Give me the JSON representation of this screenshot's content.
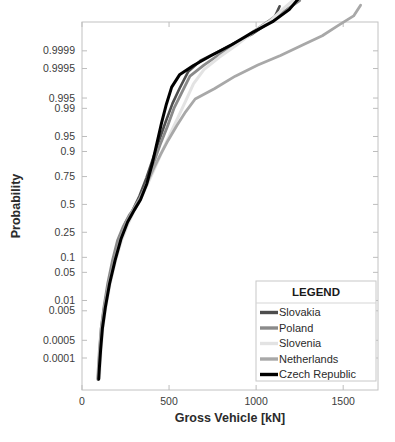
{
  "chart_data": {
    "type": "line",
    "title": "",
    "xlabel": "Gross Vehicle [kN]",
    "ylabel": "Probability",
    "grid": false,
    "legend_position": "bottom-right",
    "legend_title": "LEGEND",
    "xlim": [
      0,
      1700
    ],
    "xticks": [
      0,
      500,
      1000,
      1500
    ],
    "xticklabels": [
      "0",
      "500",
      "1000",
      "1500"
    ],
    "yscale": "normal-probability",
    "yticks": [
      0.0001,
      0.0005,
      0.005,
      0.01,
      0.05,
      0.1,
      0.25,
      0.5,
      0.75,
      0.9,
      0.95,
      0.99,
      0.995,
      0.9995,
      0.9999
    ],
    "yticklabels": [
      "0.0001",
      "0.0005",
      "0.005",
      "0.01",
      "0.05",
      "0.1",
      "0.25",
      "0.5",
      "0.75",
      "0.9",
      "0.95",
      "0.99",
      "0.995",
      "0.9995",
      "0.9999"
    ],
    "series": [
      {
        "name": "Slovakia",
        "color": "#4d4d4d",
        "width": 2.6,
        "points": [
          [
            95,
            1.2e-05
          ],
          [
            98,
            4e-05
          ],
          [
            104,
            0.0002
          ],
          [
            112,
            0.0012
          ],
          [
            128,
            0.006
          ],
          [
            150,
            0.025
          ],
          [
            180,
            0.08
          ],
          [
            215,
            0.2
          ],
          [
            250,
            0.33
          ],
          [
            290,
            0.44
          ],
          [
            330,
            0.58
          ],
          [
            370,
            0.74
          ],
          [
            405,
            0.86
          ],
          [
            440,
            0.935
          ],
          [
            480,
            0.977
          ],
          [
            520,
            0.9928
          ],
          [
            560,
            0.9975
          ],
          [
            610,
            0.99935
          ],
          [
            680,
            0.99975
          ],
          [
            780,
            0.99989
          ],
          [
            880,
            0.999955
          ],
          [
            980,
            0.999982
          ],
          [
            1060,
            0.9999935
          ],
          [
            1110,
            0.9999975
          ],
          [
            1135,
            0.9999992
          ]
        ]
      },
      {
        "name": "Poland",
        "color": "#8a8a8a",
        "width": 2.8,
        "points": [
          [
            92,
            1.1e-05
          ],
          [
            96,
            4e-05
          ],
          [
            102,
            0.00022
          ],
          [
            110,
            0.0013
          ],
          [
            126,
            0.0065
          ],
          [
            148,
            0.028
          ],
          [
            176,
            0.09
          ],
          [
            205,
            0.195
          ],
          [
            238,
            0.3
          ],
          [
            272,
            0.4
          ],
          [
            305,
            0.47
          ],
          [
            340,
            0.57
          ],
          [
            378,
            0.72
          ],
          [
            412,
            0.845
          ],
          [
            448,
            0.925
          ],
          [
            490,
            0.97
          ],
          [
            530,
            0.9905
          ],
          [
            575,
            0.9968
          ],
          [
            620,
            0.99905
          ],
          [
            700,
            0.99963
          ],
          [
            800,
            0.999875
          ],
          [
            900,
            0.999955
          ],
          [
            1000,
            0.9999885
          ],
          [
            1090,
            0.9999965
          ],
          [
            1175,
            0.9999988
          ],
          [
            1250,
            0.9999996
          ]
        ]
      },
      {
        "name": "Slovenia",
        "color": "#e3e3e3",
        "width": 3.0,
        "points": [
          [
            100,
            1.3e-05
          ],
          [
            104,
            4.5e-05
          ],
          [
            110,
            0.00024
          ],
          [
            120,
            0.0014
          ],
          [
            138,
            0.0068
          ],
          [
            162,
            0.028
          ],
          [
            192,
            0.085
          ],
          [
            228,
            0.195
          ],
          [
            262,
            0.31
          ],
          [
            300,
            0.44
          ],
          [
            340,
            0.565
          ],
          [
            380,
            0.7
          ],
          [
            420,
            0.815
          ],
          [
            460,
            0.9
          ],
          [
            505,
            0.955
          ],
          [
            550,
            0.982
          ],
          [
            595,
            0.9938
          ],
          [
            640,
            0.99825
          ],
          [
            700,
            0.99945
          ],
          [
            790,
            0.99982
          ],
          [
            890,
            0.999945
          ],
          [
            990,
            0.9999865
          ],
          [
            1080,
            0.9999955
          ],
          [
            1150,
            0.9999988
          ],
          [
            1210,
            0.9999996
          ]
        ]
      },
      {
        "name": "Netherlands",
        "color": "#a8a8a8",
        "width": 2.8,
        "points": [
          [
            90,
            1.2e-05
          ],
          [
            94,
            4.2e-05
          ],
          [
            100,
            0.00023
          ],
          [
            110,
            0.0013
          ],
          [
            128,
            0.0062
          ],
          [
            152,
            0.026
          ],
          [
            185,
            0.085
          ],
          [
            222,
            0.21
          ],
          [
            258,
            0.34
          ],
          [
            295,
            0.455
          ],
          [
            332,
            0.56
          ],
          [
            370,
            0.685
          ],
          [
            408,
            0.8
          ],
          [
            450,
            0.885
          ],
          [
            495,
            0.94
          ],
          [
            545,
            0.972
          ],
          [
            595,
            0.9875
          ],
          [
            650,
            0.99465
          ],
          [
            760,
            0.99745
          ],
          [
            880,
            0.99905
          ],
          [
            1010,
            0.99963
          ],
          [
            1140,
            0.999845
          ],
          [
            1270,
            0.999945
          ],
          [
            1380,
            0.999978
          ],
          [
            1470,
            0.9999925
          ],
          [
            1560,
            0.9999975
          ],
          [
            1600,
            0.9999993
          ]
        ]
      },
      {
        "name": "Czech Republic",
        "color": "#000000",
        "width": 3.0,
        "points": [
          [
            96,
            1.15e-05
          ],
          [
            100,
            4e-05
          ],
          [
            107,
            0.00022
          ],
          [
            117,
            0.0013
          ],
          [
            134,
            0.0063
          ],
          [
            158,
            0.027
          ],
          [
            190,
            0.088
          ],
          [
            225,
            0.205
          ],
          [
            262,
            0.335
          ],
          [
            300,
            0.445
          ],
          [
            336,
            0.545
          ],
          [
            372,
            0.69
          ],
          [
            405,
            0.845
          ],
          [
            432,
            0.935
          ],
          [
            458,
            0.977
          ],
          [
            485,
            0.9925
          ],
          [
            515,
            0.99775
          ],
          [
            560,
            0.99915
          ],
          [
            640,
            0.999615
          ],
          [
            740,
            0.99984
          ],
          [
            860,
            0.999945
          ],
          [
            980,
            0.9999845
          ],
          [
            1100,
            0.9999955
          ],
          [
            1190,
            0.9999988
          ],
          [
            1245,
            0.9999997
          ]
        ]
      }
    ]
  },
  "legend": {
    "title": "LEGEND",
    "items": [
      {
        "label": "Slovakia",
        "color": "#4d4d4d"
      },
      {
        "label": "Poland",
        "color": "#8a8a8a"
      },
      {
        "label": "Slovenia",
        "color": "#e3e3e3"
      },
      {
        "label": "Netherlands",
        "color": "#a8a8a8"
      },
      {
        "label": "Czech Republic",
        "color": "#000000"
      }
    ]
  }
}
